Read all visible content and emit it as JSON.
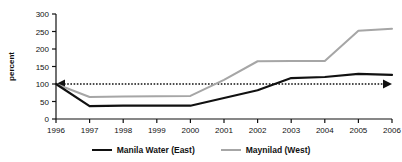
{
  "chart_data": {
    "type": "line",
    "title": "",
    "xlabel": "",
    "ylabel": "percent",
    "categories": [
      "1996",
      "1997",
      "1998",
      "1999",
      "2000",
      "2001",
      "2002",
      "2003",
      "2004",
      "2005",
      "2006"
    ],
    "x": [
      1996,
      1997,
      1998,
      1999,
      2000,
      2001,
      2002,
      2003,
      2004,
      2005,
      2006
    ],
    "xlim": [
      1996,
      2006
    ],
    "ylim": [
      0,
      300
    ],
    "yticks": [
      0,
      50,
      100,
      150,
      200,
      250,
      300
    ],
    "ytick_labels": [
      "0",
      "50",
      "100",
      "150",
      "200",
      "250",
      "300"
    ],
    "grid": false,
    "legend_position": "bottom",
    "series": [
      {
        "name": "Manila Water (East)",
        "color": "#111111",
        "values": [
          100,
          37,
          38,
          38,
          38,
          60,
          82,
          117,
          120,
          129,
          126
        ]
      },
      {
        "name": "Maynilad (West)",
        "color": "#a6a6a6",
        "values": [
          100,
          63,
          64,
          65,
          66,
          112,
          165,
          166,
          166,
          252,
          258
        ]
      }
    ],
    "annotations": [
      {
        "name": "baseline-100-percent",
        "type": "double-headed-dotted-arrow",
        "y": 100,
        "color": "#111111",
        "style": "dotted"
      }
    ]
  },
  "legend": {
    "items": [
      {
        "label": "Manila Water (East)",
        "color": "#111111"
      },
      {
        "label": "Maynilad (West)",
        "color": "#a6a6a6"
      }
    ]
  },
  "axis": {
    "y_title": "percent"
  }
}
